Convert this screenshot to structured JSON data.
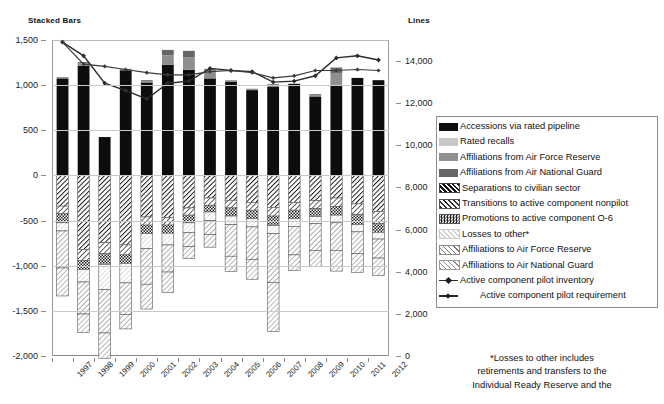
{
  "headers": {
    "left": "Stacked Bars",
    "right": "Lines"
  },
  "legend": {
    "items": [
      {
        "label": "Accessions via rated pipeline",
        "swatch": "solid-black",
        "key": "accessions"
      },
      {
        "label": "Rated recalls",
        "swatch": "solid-lightgray",
        "key": "recalls"
      },
      {
        "label": "Affiliations from Air Force Reserve",
        "swatch": "solid-gray",
        "key": "aff_from_afr"
      },
      {
        "label": "Affiliations from Air National Guard",
        "swatch": "solid-darkgray",
        "key": "aff_from_ang"
      },
      {
        "label": "Separations to civilian sector",
        "swatch": "hatch-black",
        "key": "separations"
      },
      {
        "label": "Transitions to active component nonpilot",
        "swatch": "hatch-dark",
        "key": "transitions"
      },
      {
        "label": "Promotions to active component O-6",
        "swatch": "checker-dark",
        "key": "promotions"
      },
      {
        "label": "Losses to other*",
        "swatch": "hatch-light",
        "key": "losses_other"
      },
      {
        "label": "Affiliations to Air Force Reserve",
        "swatch": "hatch-med",
        "key": "aff_to_afr"
      },
      {
        "label": "Affiliations to Air National Guard",
        "swatch": "hatch-med2",
        "key": "aff_to_ang"
      },
      {
        "label": "Active component pilot inventory",
        "swatch": "line-marker",
        "key": "inventory"
      },
      {
        "label": "Active component pilot requirement",
        "swatch": "line-marker-thin",
        "key": "requirement",
        "indent": true
      }
    ]
  },
  "footnote": {
    "line1": "*Losses to other includes",
    "line2": "retirements and transfers to the",
    "line3": "Individual Ready Reserve and the"
  },
  "chart_data": {
    "type": "bar",
    "title": "",
    "xlabel": "",
    "ylabel": "Stacked Bars",
    "y2label": "Lines",
    "grid": true,
    "legend_position": "right",
    "categories": [
      "1997",
      "1998",
      "1999",
      "2000",
      "2001",
      "2002",
      "2003",
      "2004",
      "2005",
      "2006",
      "2007",
      "2008",
      "2009",
      "2010",
      "2011",
      "2012"
    ],
    "ylim": [
      -2000,
      1500
    ],
    "yticks": [
      1500,
      1000,
      500,
      0,
      -500,
      -1000,
      -1500,
      -2000
    ],
    "yticklabels": [
      "1,500",
      "1,000",
      "500",
      "0",
      "-500",
      "-1,000",
      "-1,500",
      "-2,000"
    ],
    "y2lim": [
      0,
      15000
    ],
    "y2ticks": [
      14000,
      12000,
      10000,
      8000,
      6000,
      4000,
      2000,
      0
    ],
    "y2ticklabels": [
      "14,000",
      "12,000",
      "10,000",
      "8,000",
      "6,000",
      "4,000",
      "2,000",
      "0"
    ],
    "stacked_positive": [
      {
        "name": "Accessions via rated pipeline",
        "color": "#0d0d0d",
        "values": [
          1075,
          1215,
          425,
          1165,
          1030,
          1225,
          1170,
          1075,
          1040,
          945,
          985,
          1015,
          875,
          1005,
          1080,
          1055
        ]
      },
      {
        "name": "Rated recalls",
        "color": "#c7c7c7",
        "values": [
          0,
          0,
          0,
          0,
          0,
          0,
          0,
          0,
          0,
          0,
          0,
          0,
          0,
          0,
          0,
          0
        ]
      },
      {
        "name": "Affiliations from Air Force Reserve",
        "color": "#8f8f8f",
        "values": [
          10,
          25,
          0,
          10,
          15,
          105,
          140,
          95,
          10,
          10,
          15,
          0,
          10,
          130,
          0,
          0
        ]
      },
      {
        "name": "Affiliations from Air National Guard",
        "color": "#666666",
        "values": [
          5,
          15,
          0,
          5,
          10,
          60,
          70,
          10,
          5,
          5,
          10,
          0,
          15,
          60,
          0,
          0
        ]
      }
    ],
    "stacked_negative": [
      {
        "name": "Separations to civilian sector",
        "color": "#2f2f2f",
        "pattern": "hatch-dark",
        "values": [
          -340,
          -820,
          -745,
          -770,
          -460,
          -465,
          -360,
          -250,
          -275,
          -300,
          -355,
          -300,
          -280,
          -250,
          -315,
          -400
        ]
      },
      {
        "name": "Transitions to active component nonpilot",
        "color": "#4a4a4a",
        "pattern": "hatch-med",
        "values": [
          -85,
          -125,
          -120,
          -110,
          -90,
          -85,
          -80,
          -80,
          -85,
          -85,
          -95,
          -85,
          -85,
          -95,
          -120,
          -130
        ]
      },
      {
        "name": "Promotions to active component O-6",
        "color": "#3d3d3d",
        "pattern": "checker",
        "values": [
          -100,
          -95,
          -120,
          -95,
          -95,
          -90,
          -85,
          -75,
          -90,
          -95,
          -105,
          -95,
          -90,
          -95,
          -110,
          -100
        ]
      },
      {
        "name": "Losses to other*",
        "color": "#dcdcdc",
        "pattern": "hatch-light",
        "values": [
          -90,
          -140,
          -280,
          -215,
          -165,
          -130,
          -110,
          -95,
          -95,
          -90,
          -90,
          -85,
          -80,
          -85,
          -80,
          -75
        ]
      },
      {
        "name": "Affiliations to Air Force Reserve",
        "color": "#9b9b9b",
        "pattern": "hatch-med2",
        "values": [
          -410,
          -355,
          -480,
          -350,
          -395,
          -300,
          -155,
          -155,
          -350,
          -360,
          -540,
          -315,
          -295,
          -305,
          -240,
          -210
        ]
      },
      {
        "name": "Affiliations to Air National Guard",
        "color": "#8a8a8a",
        "pattern": "hatch-med3",
        "values": [
          -310,
          -205,
          -280,
          -160,
          -275,
          -225,
          -130,
          -140,
          -170,
          -220,
          -545,
          -175,
          -180,
          -230,
          -210,
          -195
        ]
      }
    ],
    "lines": [
      {
        "name": "Active component pilot inventory",
        "axis": "y2",
        "marker": "diamond",
        "color": "#2b2b2b",
        "values": [
          14900,
          14250,
          12950,
          12600,
          12200,
          12950,
          13050,
          13650,
          13550,
          13500,
          13000,
          13050,
          13300,
          14150,
          14250,
          14050
        ]
      },
      {
        "name": "Active component pilot requirement",
        "axis": "y2",
        "marker": "diamond",
        "color": "#3a3a3a",
        "values": [
          14900,
          13850,
          13750,
          13600,
          13450,
          13350,
          13350,
          13500,
          13550,
          13450,
          13200,
          13300,
          13550,
          13550,
          13600,
          13550
        ]
      }
    ]
  }
}
